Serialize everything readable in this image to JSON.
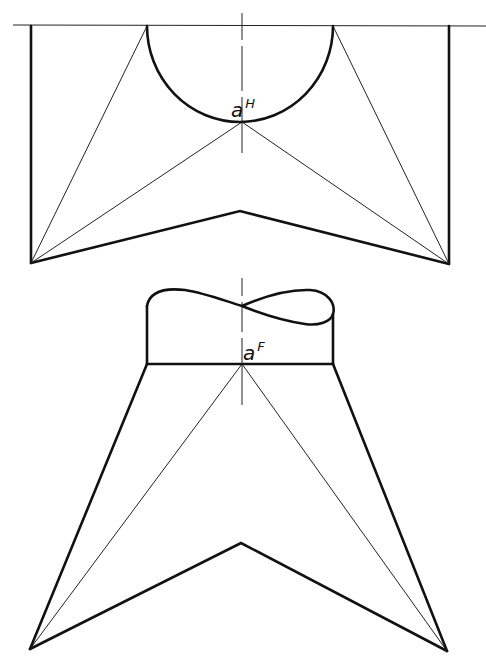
{
  "figure": {
    "type": "orthographic projection drawing",
    "views": [
      {
        "name": "top-view",
        "point_label": {
          "base": "a",
          "superscript": "H"
        }
      },
      {
        "name": "front-view",
        "point_label": {
          "base": "a",
          "superscript": "F"
        }
      }
    ],
    "colors": {
      "line": "#111111",
      "background": "#ffffff"
    }
  }
}
